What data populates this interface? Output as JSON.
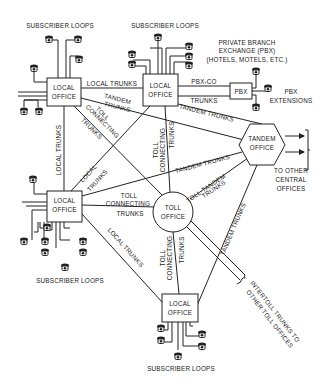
{
  "diagram": {
    "nodes": {
      "local_office_nw": {
        "line1": "LOCAL",
        "line2": "OFFICE"
      },
      "local_office_n": {
        "line1": "LOCAL",
        "line2": "OFFICE"
      },
      "local_office_w": {
        "line1": "LOCAL",
        "line2": "OFFICE"
      },
      "local_office_s": {
        "line1": "LOCAL",
        "line2": "OFFICE"
      },
      "pbx": {
        "label": "PBX"
      },
      "tandem_office": {
        "line1": "TANDEM",
        "line2": "OFFICE"
      },
      "toll_office": {
        "line1": "TOLL",
        "line2": "OFFICE"
      }
    },
    "labels": {
      "subscriber_loops_nw": "SUBSCRIBER LOOPS",
      "subscriber_loops_n": "SUBSCRIBER LOOPS",
      "subscriber_loops_w": "SUBSCRIBER LOOPS",
      "subscriber_loops_s": "SUBSCRIBER LOOPS",
      "pbx_title_1": "PRIVATE BRANCH",
      "pbx_title_2": "EXCHANGE (PBX)",
      "pbx_title_3": "(HOTELS, MOTELS, ETC.)",
      "pbx_ext_1": "PBX",
      "pbx_ext_2": "EXTENSIONS",
      "other_co_1": "TO OTHER",
      "other_co_2": "CENTRAL",
      "other_co_3": "OFFICES",
      "intertoll_1": "INTERTOLL TRUNKS TO",
      "intertoll_2": "OTHER TOLL OFFICES"
    },
    "edges": {
      "local_trunks_top": "LOCAL TRUNKS",
      "tandem_trunks_nw_1": "TANDEM",
      "tandem_trunks_nw_2": "TRUNKS",
      "toll_connecting_nw_1": "TOLL",
      "toll_connecting_nw_2": "CONNECTING",
      "toll_connecting_nw_3": "TRUNKS",
      "pbx_co_1": "PBX-CO",
      "pbx_co_2": "TRUNKS",
      "tandem_trunks_n": "TANDEM TRUNKS",
      "local_trunks_left": "LOCAL TRUNKS",
      "local_trunks_diag_1": "LOCAL",
      "local_trunks_diag_2": "TRUNKS",
      "toll_connecting_n_1": "TOLL",
      "toll_connecting_n_2": "CONNECTING",
      "toll_connecting_n_3": "TRUNKS",
      "tandem_trunks_w": "TANDEM TRUNKS",
      "toll_tandem_1": "TOLL-TANDEM",
      "toll_tandem_2": "TRUNKS",
      "toll_connecting_w_1": "TOLL",
      "toll_connecting_w_2": "CONNECTING",
      "toll_connecting_w_3": "TRUNKS",
      "local_trunks_sw": "LOCAL TRUNKS",
      "toll_connecting_s_1": "TOLL",
      "toll_connecting_s_2": "CONNECTING",
      "toll_connecting_s_3": "TRUNKS",
      "tandem_trunks_s": "TANDEM TRUNKS"
    }
  }
}
